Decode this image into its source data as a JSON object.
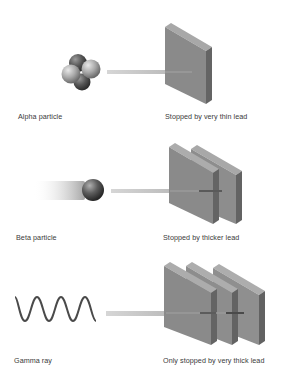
{
  "diagram": {
    "title": "",
    "colors": {
      "background": "#ffffff",
      "lead_front": "#8a8a8a",
      "lead_side": "#6c6c6c",
      "lead_top": "#a8a8a8",
      "beam": "#c8c8c8",
      "wave": "#4a4a4a",
      "label_text": "#3a3a3a"
    },
    "rows": [
      {
        "particle": "Alpha particle",
        "particle_icon": "helium-nucleus-icon",
        "shield": "Stopped by very thin lead",
        "lead_sheets": 1
      },
      {
        "particle": "Beta particle",
        "particle_icon": "electron-ball-icon",
        "shield": "Stopped by thicker lead",
        "lead_sheets": 2
      },
      {
        "particle": "Gamma ray",
        "particle_icon": "wave-icon",
        "shield": "Only stopped by very thick lead",
        "lead_sheets": 3
      }
    ]
  }
}
